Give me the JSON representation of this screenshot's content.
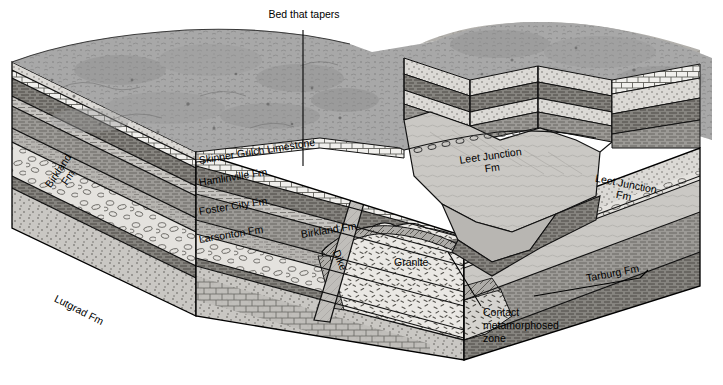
{
  "figure": {
    "type": "geologic-block-diagram",
    "title_visible": false,
    "background": "#ffffff",
    "ink": "#000000"
  },
  "palette": {
    "terrain_gray": "#a8a8a8",
    "terrain_gray_dark": "#8f8f8f",
    "shale_gray": "#9a9a9a",
    "shale_gray_dark": "#7e7e7e",
    "sandstone_light": "#d8d6d2",
    "limestone_white": "#f2f1ee",
    "conglomerate": "#e2e0dc",
    "granite": "#e8e6e2",
    "siltstone": "#c4c2be",
    "valley_face": "#c8c6c2",
    "dike_fill": "#bdbbb7",
    "contact_zone": "#b4b2ae",
    "leader": "#000000"
  },
  "annotations": [
    {
      "id": "bed-that-tapers",
      "text": "Bed that tapers",
      "x": 246,
      "y": 14,
      "leader": "vertical"
    },
    {
      "id": "contact-metamorphosed-zone",
      "line1": "Contact",
      "line2": "metamorphosed",
      "line3": "zone",
      "x": 483,
      "y": 312,
      "leader": "diagonal"
    }
  ],
  "formation_labels": [
    {
      "id": "skinner-gulch-limestone",
      "text": "Skinner Gulch Limestone",
      "x": 198,
      "y": 160,
      "rotate": -9
    },
    {
      "id": "hamlinville-fm",
      "text": "Hamlinville Fm",
      "x": 198,
      "y": 181,
      "rotate": -9
    },
    {
      "id": "foster-city-fm",
      "text": "Foster City Fm",
      "x": 198,
      "y": 210,
      "rotate": -9
    },
    {
      "id": "larsonton-fm",
      "text": "Larsonton Fm",
      "x": 198,
      "y": 238,
      "rotate": -9
    },
    {
      "id": "birkland-fm-front",
      "text": "Birkland Fm",
      "x": 300,
      "y": 232,
      "rotate": -9
    },
    {
      "id": "birkland-fm-left",
      "text": "Birkland",
      "text2": "Fm",
      "x": 36,
      "y": 196,
      "rotate": -56
    },
    {
      "id": "lutgrad-fm",
      "text": "Lutgrad Fm",
      "x": 58,
      "y": 296,
      "rotate": 27
    },
    {
      "id": "dike",
      "text": "Dike",
      "x": 342,
      "y": 252,
      "rotate": 68
    },
    {
      "id": "granite",
      "text": "Granite",
      "x": 394,
      "y": 262,
      "rotate": 0
    },
    {
      "id": "leet-junction-fm-valley",
      "text": "Leet Junction",
      "text2": "Fm",
      "x": 462,
      "y": 160,
      "rotate": -8
    },
    {
      "id": "leet-junction-fm-right",
      "text": "Leet Junction",
      "text2": "Fm",
      "x": 592,
      "y": 176,
      "rotate": 11
    },
    {
      "id": "tarburg-fm",
      "text": "Tarburg Fm",
      "x": 585,
      "y": 277,
      "rotate": -11
    }
  ],
  "strata_sequence": [
    {
      "name": "Skinner Gulch Limestone",
      "rock": "limestone",
      "pattern": "brick"
    },
    {
      "name": "Hamlinville Fm",
      "rock": "shale",
      "pattern": "dashes"
    },
    {
      "name": "Foster City Fm",
      "rock": "shale",
      "pattern": "dashes"
    },
    {
      "name": "Larsonton Fm",
      "rock": "siltstone",
      "pattern": "fine-dashes"
    },
    {
      "name": "Birkland Fm",
      "rock": "conglomerate",
      "pattern": "pebbles"
    },
    {
      "name": "Lutgrad Fm",
      "rock": "limestone-sandstone",
      "pattern": "brick-stipple"
    },
    {
      "name": "Leet Junction Fm",
      "rock": "sandstone",
      "pattern": "stipple"
    },
    {
      "name": "Tarburg Fm",
      "rock": "shale",
      "pattern": "dashes"
    },
    {
      "name": "Granite",
      "rock": "igneous-intrusive",
      "pattern": "granite-dashes"
    },
    {
      "name": "Dike",
      "rock": "igneous-intrusive",
      "pattern": "plain"
    }
  ]
}
